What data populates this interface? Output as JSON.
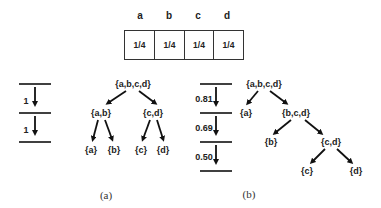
{
  "table": {
    "headers": [
      "a",
      "b",
      "c",
      "d"
    ],
    "values": [
      "1/4",
      "1/4",
      "1/4",
      "1/4"
    ]
  },
  "panel_a": {
    "caption": "(a)",
    "scale": {
      "levels": 3,
      "step_labels": [
        "1",
        "1"
      ]
    },
    "tree": {
      "root": "{a,b,c,d}",
      "level1": [
        "{a,b}",
        "{c,d}"
      ],
      "level2": [
        "{a}",
        "{b}",
        "{c}",
        "{d}"
      ]
    }
  },
  "panel_b": {
    "caption": "(b)",
    "scale": {
      "levels": 4,
      "step_labels": [
        "0.81",
        "0.69",
        "0.50"
      ]
    },
    "tree": {
      "root": "{a,b,c,d}",
      "level1": [
        "{a}",
        "{b,c,d}"
      ],
      "level2": [
        "{b}",
        "{c,d}"
      ],
      "level3": [
        "{c}",
        "{d}"
      ]
    }
  }
}
